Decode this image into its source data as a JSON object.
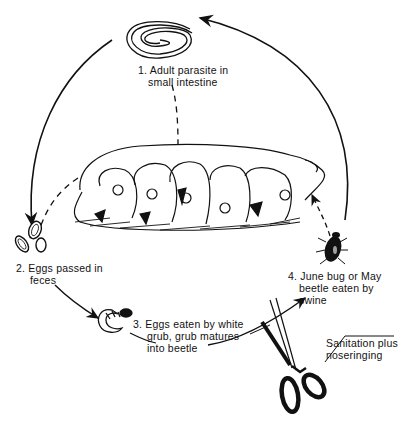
{
  "diagram": {
    "type": "life-cycle",
    "stages": [
      {
        "number": "1.",
        "lines": [
          "Adult parasite in",
          "small intestine"
        ],
        "icon": "worm-icon"
      },
      {
        "number": "2.",
        "lines": [
          "Eggs passed in",
          "feces"
        ],
        "icon": "eggs-icon"
      },
      {
        "number": "3.",
        "lines": [
          "Eggs eaten by white",
          "grub, grub matures",
          "into beetle"
        ],
        "icon": "grub-icon"
      },
      {
        "number": "4.",
        "lines": [
          "June bug or May",
          "beetle eaten by",
          "swine"
        ],
        "icon": "beetle-icon"
      }
    ],
    "control": {
      "lines": [
        "Sanitation plus",
        "noseringing"
      ],
      "icon": "scissors-icon"
    },
    "center_icon": "sow-with-piglets-icon",
    "colors": {
      "ink": "#111111",
      "background": "#ffffff"
    }
  }
}
